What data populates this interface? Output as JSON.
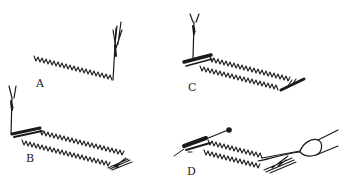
{
  "figure": {
    "panels": [
      {
        "id": "A",
        "label": "A",
        "label_pos": [
          36,
          78
        ],
        "description": "single row of zigzag stitching with needle raised at right end"
      },
      {
        "id": "B",
        "label": "B",
        "label_pos": [
          26,
          153
        ],
        "description": "two rows of zigzag stitching with needle at left end and bar tack"
      },
      {
        "id": "C",
        "label": "C",
        "label_pos": [
          188,
          82
        ],
        "description": "two rows of zigzag stitching forming rectangle, needle at left bar tack"
      },
      {
        "id": "D",
        "label": "D",
        "label_pos": [
          187,
          166
        ],
        "description": "finished buttonhole with pin at top and seam ripper cutting between rows"
      }
    ],
    "colors": {
      "ink": "#1a1a1a",
      "background": "#ffffff"
    }
  }
}
